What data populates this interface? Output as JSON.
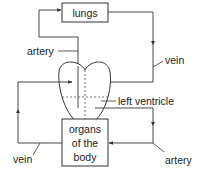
{
  "diagram": {
    "boxes": {
      "lungs": "lungs",
      "organs": [
        "organs",
        "of the",
        "body"
      ]
    },
    "labels": {
      "artery_top": "artery",
      "vein_right": "vein",
      "left_ventricle": "left ventricle",
      "vein_bottom": "vein",
      "artery_bottom": "artery"
    },
    "colors": {
      "line": "#333333",
      "background": "#ffffff"
    }
  }
}
